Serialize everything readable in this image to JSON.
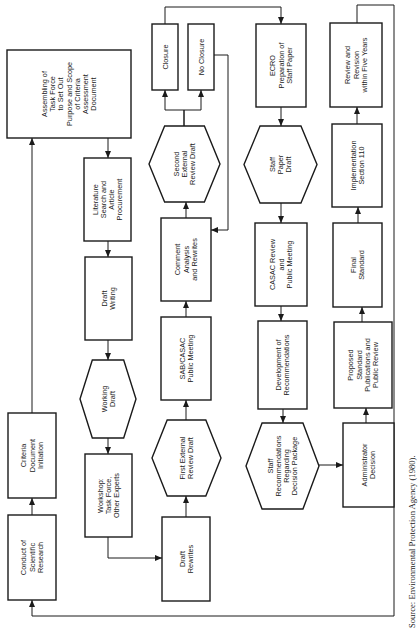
{
  "diagram": {
    "orientation": "rotated-90-ccw",
    "nodes": [
      {
        "id": "conduct-research",
        "shape": "rect",
        "lines": [
          "Conduct of",
          "Scientific",
          "Research"
        ]
      },
      {
        "id": "criteria-initiation",
        "shape": "rect",
        "lines": [
          "Criteria",
          "Document",
          "Initiation"
        ]
      },
      {
        "id": "assembling-task-force",
        "shape": "rect",
        "lines": [
          "Assembling of",
          "Task Force",
          "to Set Out",
          "Purpose and Scope",
          "of Criteria",
          "Assessment",
          "Document"
        ]
      },
      {
        "id": "literature-search",
        "shape": "rect",
        "lines": [
          "Literature",
          "Search and",
          "Article",
          "Procurement"
        ]
      },
      {
        "id": "draft-writing",
        "shape": "rect",
        "lines": [
          "Draft",
          "Writing"
        ]
      },
      {
        "id": "working-draft",
        "shape": "hexagon",
        "lines": [
          "Working",
          "Draft"
        ]
      },
      {
        "id": "workshop",
        "shape": "rect",
        "lines": [
          "Workshop:",
          "Task Force,",
          "Other Experts"
        ]
      },
      {
        "id": "draft-rewrites",
        "shape": "rect",
        "lines": [
          "Draft",
          "Rewrites"
        ]
      },
      {
        "id": "first-external-review",
        "shape": "hexagon",
        "lines": [
          "First External",
          "Review Draft"
        ]
      },
      {
        "id": "sab-casac-meeting",
        "shape": "rect",
        "lines": [
          "SAB/CASAC",
          "Public Meeting"
        ]
      },
      {
        "id": "comment-analysis",
        "shape": "rect",
        "lines": [
          "Comment",
          "Analysis",
          "and Rewrites"
        ]
      },
      {
        "id": "second-external-review",
        "shape": "hexagon",
        "lines": [
          "Second",
          "External",
          "Review Draft"
        ]
      },
      {
        "id": "closure",
        "shape": "rect",
        "lines": [
          "Closure"
        ]
      },
      {
        "id": "no-closure",
        "shape": "rect",
        "lines": [
          "No Closure"
        ]
      },
      {
        "id": "ecro-staff-paper",
        "shape": "rect",
        "lines": [
          "ECRO",
          "Preparation of",
          "Staff Paper"
        ]
      },
      {
        "id": "staff-paper-draft",
        "shape": "hexagon",
        "lines": [
          "Staff",
          "Paper",
          "Draft"
        ]
      },
      {
        "id": "casac-review",
        "shape": "rect",
        "lines": [
          "CASAC Review",
          "and",
          "Public Meeting"
        ]
      },
      {
        "id": "development-recommendations",
        "shape": "rect",
        "lines": [
          "Development of",
          "Recommendations"
        ]
      },
      {
        "id": "staff-recommendations",
        "shape": "hexagon",
        "lines": [
          "Staff",
          "Recommendations",
          "Regarding",
          "Decision Package"
        ]
      },
      {
        "id": "administrator-decision",
        "shape": "rect",
        "lines": [
          "Administrator",
          "Decision"
        ]
      },
      {
        "id": "proposed-standard",
        "shape": "rect",
        "lines": [
          "Proposed",
          "Standard",
          "Publications and",
          "Public Review"
        ]
      },
      {
        "id": "final-standard",
        "shape": "rect",
        "lines": [
          "Final",
          "Standard"
        ]
      },
      {
        "id": "implementation",
        "shape": "rect",
        "lines": [
          "Implementation",
          "Section 110"
        ]
      },
      {
        "id": "review-revision",
        "shape": "rect",
        "lines": [
          "Review and",
          "Revision",
          "within Five Years"
        ]
      }
    ],
    "edges": [
      {
        "from": "conduct-research",
        "to": "criteria-initiation"
      },
      {
        "from": "criteria-initiation",
        "to": "assembling-task-force"
      },
      {
        "from": "assembling-task-force",
        "to": "literature-search"
      },
      {
        "from": "literature-search",
        "to": "draft-writing"
      },
      {
        "from": "draft-writing",
        "to": "working-draft"
      },
      {
        "from": "working-draft",
        "to": "workshop"
      },
      {
        "from": "workshop",
        "to": "draft-rewrites"
      },
      {
        "from": "draft-rewrites",
        "to": "first-external-review"
      },
      {
        "from": "first-external-review",
        "to": "sab-casac-meeting"
      },
      {
        "from": "sab-casac-meeting",
        "to": "comment-analysis"
      },
      {
        "from": "comment-analysis",
        "to": "second-external-review"
      },
      {
        "from": "second-external-review",
        "to": "closure"
      },
      {
        "from": "second-external-review",
        "to": "no-closure"
      },
      {
        "from": "no-closure",
        "to": "comment-analysis"
      },
      {
        "from": "closure",
        "to": "ecro-staff-paper"
      },
      {
        "from": "ecro-staff-paper",
        "to": "staff-paper-draft"
      },
      {
        "from": "staff-paper-draft",
        "to": "casac-review"
      },
      {
        "from": "casac-review",
        "to": "development-recommendations"
      },
      {
        "from": "development-recommendations",
        "to": "staff-recommendations"
      },
      {
        "from": "staff-recommendations",
        "to": "administrator-decision"
      },
      {
        "from": "administrator-decision",
        "to": "proposed-standard"
      },
      {
        "from": "proposed-standard",
        "to": "final-standard"
      },
      {
        "from": "final-standard",
        "to": "implementation"
      },
      {
        "from": "implementation",
        "to": "review-revision"
      },
      {
        "from": "review-revision",
        "to": "conduct-research"
      }
    ]
  },
  "source_note": "Source: Environmental Protection Agency (1980)."
}
